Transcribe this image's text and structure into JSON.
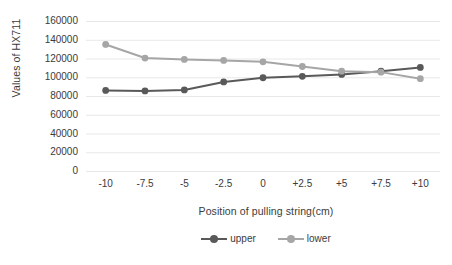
{
  "chart_data": {
    "type": "line",
    "title": "",
    "xlabel": "Position of pulling string(cm)",
    "ylabel": "Values of HX711",
    "categories": [
      "-10",
      "-7.5",
      "-5",
      "-2.5",
      "0",
      "+2.5",
      "+5",
      "+7.5",
      "+10"
    ],
    "ylim": [
      0,
      160000
    ],
    "ytick_labels": [
      "0",
      "20000",
      "40000",
      "60000",
      "80000",
      "100000",
      "120000",
      "140000",
      "160000"
    ],
    "ytick_values": [
      0,
      20000,
      40000,
      60000,
      80000,
      100000,
      120000,
      140000,
      160000
    ],
    "grid": true,
    "legend_position": "bottom",
    "series": [
      {
        "name": "upper",
        "color": "#595959",
        "values": [
          86500,
          86000,
          87000,
          95500,
          100000,
          101500,
          103500,
          107000,
          111000
        ]
      },
      {
        "name": "lower",
        "color": "#a6a6a6",
        "values": [
          135500,
          121000,
          119500,
          118500,
          117000,
          112000,
          107000,
          106000,
          99000
        ]
      }
    ]
  },
  "colors": {
    "upper": "#595959",
    "lower": "#a6a6a6",
    "grid": "#e8e8e8",
    "text": "#3b3b3b",
    "background": "#ffffff"
  }
}
